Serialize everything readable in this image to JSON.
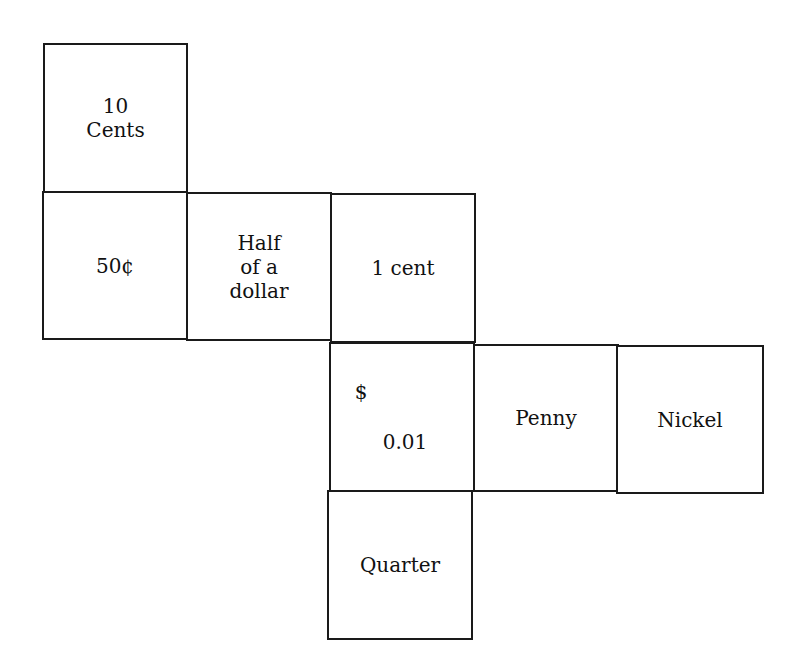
{
  "diagram": {
    "type": "cube-net",
    "cells": [
      {
        "id": "top",
        "text": "10\nCents"
      },
      {
        "id": "row2-a",
        "text": "50¢"
      },
      {
        "id": "row2-b",
        "text": "Half\nof a\ndollar"
      },
      {
        "id": "row2-c",
        "text": "1 cent"
      },
      {
        "id": "row3-a",
        "symbol": "$",
        "value": "0.01"
      },
      {
        "id": "row3-b",
        "text": "Penny"
      },
      {
        "id": "row3-c",
        "text": "Nickel"
      },
      {
        "id": "bottom",
        "text": "Quarter"
      }
    ]
  }
}
